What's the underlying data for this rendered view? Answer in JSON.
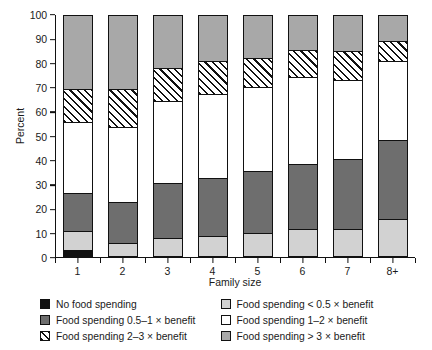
{
  "chart_data": {
    "type": "bar",
    "title": "",
    "subtitle": "",
    "xlabel": "Family size",
    "ylabel": "Percent",
    "ylim": [
      0,
      100
    ],
    "yticks": [
      0,
      10,
      20,
      30,
      40,
      50,
      60,
      70,
      80,
      90,
      100
    ],
    "grid": false,
    "legend_position": "bottom",
    "stacked": true,
    "stack_total": 100,
    "categories": [
      "1",
      "2",
      "3",
      "4",
      "5",
      "6",
      "7",
      "8+"
    ],
    "series": [
      {
        "name": "No food spending",
        "key": "no-food-spending",
        "color": "#111111",
        "pattern": "solid",
        "values": [
          2,
          0,
          0,
          0,
          0,
          0,
          0,
          0
        ]
      },
      {
        "name": "Food spending < 0.5 × benefit",
        "key": "lt-half-benefit",
        "color": "#d2d2d2",
        "pattern": "solid",
        "values": [
          8,
          5,
          7,
          8,
          9,
          11,
          11,
          15
        ]
      },
      {
        "name": "Food spending 0.5–1 × benefit",
        "key": "half-to-one-benefit",
        "color": "#6e6e6e",
        "pattern": "solid",
        "values": [
          16,
          17,
          23,
          24,
          26,
          27,
          29,
          33
        ]
      },
      {
        "name": "Food spending 1–2 × benefit",
        "key": "one-to-two-benefit",
        "color": "#ffffff",
        "pattern": "solid",
        "values": [
          29.5,
          31.5,
          34,
          35,
          35,
          36,
          33,
          33
        ]
      },
      {
        "name": "Food spending 2–3 × benefit",
        "key": "two-to-three-benefit",
        "color": "#ffffff",
        "pattern": "diagonal-hatch",
        "values": [
          13.5,
          15.5,
          14,
          14,
          12,
          11.5,
          12,
          8
        ]
      },
      {
        "name": "Food spending > 3 × benefit",
        "key": "gt-three-benefit",
        "color": "#a8a8a8",
        "pattern": "solid",
        "values": [
          31,
          31,
          22,
          19,
          18,
          14.5,
          15,
          11
        ]
      }
    ],
    "cumulative_tops": {
      "1": [
        2,
        10,
        26,
        55.5,
        69,
        100
      ],
      "2": [
        0,
        5,
        22,
        53.5,
        69,
        100
      ],
      "3": [
        0,
        7,
        30,
        64,
        78,
        100
      ],
      "4": [
        0,
        8,
        32,
        67,
        81,
        100
      ],
      "5": [
        0,
        9,
        35,
        70,
        82,
        100
      ],
      "6": [
        0,
        11,
        38,
        74,
        85.5,
        100
      ],
      "7": [
        0,
        11,
        40,
        73,
        85,
        100
      ],
      "8+": [
        0,
        15,
        48,
        81,
        89,
        100
      ]
    }
  },
  "legend": {
    "items": [
      {
        "label": "No food spending",
        "swatch": "black"
      },
      {
        "label": "Food spending < 0.5 × benefit",
        "swatch": "ltgray"
      },
      {
        "label": "Food spending 0.5–1 × benefit",
        "swatch": "dkgray"
      },
      {
        "label": "Food spending 1–2 × benefit",
        "swatch": "white"
      },
      {
        "label": "Food spending 2–3 × benefit",
        "swatch": "hatch"
      },
      {
        "label": "Food spending > 3 × benefit",
        "swatch": "midgray"
      }
    ]
  },
  "colors": {
    "no_food_spending": "#111111",
    "lt_half_benefit": "#d2d2d2",
    "half_to_one_benefit": "#6e6e6e",
    "one_to_two_benefit": "#ffffff",
    "two_to_three_benefit": "#ffffff",
    "gt_three_benefit": "#a8a8a8",
    "axis": "#111111",
    "background": "#ffffff"
  }
}
